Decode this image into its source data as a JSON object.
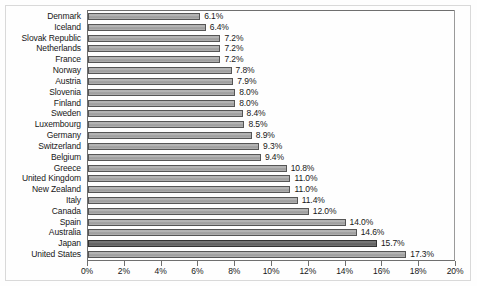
{
  "chart_data": {
    "type": "bar",
    "orientation": "horizontal",
    "title": "",
    "subtitle": "",
    "xlabel": "",
    "ylabel": "",
    "xlim": [
      0,
      20
    ],
    "xtick_step": 2,
    "grid": false,
    "legend": null,
    "value_suffix": "%",
    "categories": [
      "Denmark",
      "Iceland",
      "Slovak Republic",
      "Netherlands",
      "France",
      "Norway",
      "Austria",
      "Slovenia",
      "Finland",
      "Sweden",
      "Luxembourg",
      "Germany",
      "Switzerland",
      "Belgium",
      "Greece",
      "United Kingdom",
      "New Zealand",
      "Italy",
      "Canada",
      "Spain",
      "Australia",
      "Japan",
      "United States"
    ],
    "values": [
      6.1,
      6.4,
      7.2,
      7.2,
      7.2,
      7.8,
      7.9,
      8.0,
      8.0,
      8.4,
      8.5,
      8.9,
      9.3,
      9.4,
      10.8,
      11.0,
      11.0,
      11.4,
      12.0,
      14.0,
      14.6,
      15.7,
      17.3
    ],
    "value_labels": [
      "6.1%",
      "6.4%",
      "7.2%",
      "7.2%",
      "7.2%",
      "7.8%",
      "7.9%",
      "8.0%",
      "8.0%",
      "8.4%",
      "8.5%",
      "8.9%",
      "9.3%",
      "9.4%",
      "10.8%",
      "11.0%",
      "11.0%",
      "11.4%",
      "12.0%",
      "14.0%",
      "14.6%",
      "15.7%",
      "17.3%"
    ],
    "highlight_index": 22,
    "xtick_labels": [
      "0%",
      "2%",
      "4%",
      "6%",
      "8%",
      "10%",
      "12%",
      "14%",
      "16%",
      "18%",
      "20%"
    ],
    "xticks": [
      0,
      2,
      4,
      6,
      8,
      10,
      12,
      14,
      16,
      18,
      20
    ],
    "colors": {
      "bar_fill": "#a8a8a8",
      "bar_edge": "#555555",
      "bar_highlight_fill": "#6e6e6e",
      "bar_highlight_edge": "#333333",
      "axis": "#6f6f6f",
      "text": "#171717",
      "background": "#ffffff"
    }
  }
}
